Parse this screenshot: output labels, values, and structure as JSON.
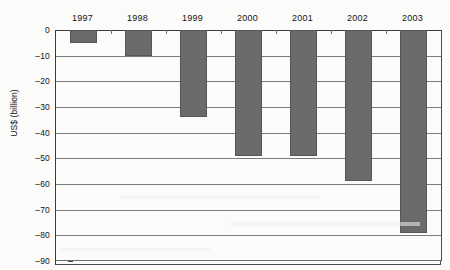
{
  "chart_data": {
    "type": "bar",
    "title": "",
    "xlabel": "",
    "ylabel": "US$ (billion)",
    "categories": [
      "1997",
      "1998",
      "1999",
      "2000",
      "2001",
      "2002",
      "2003"
    ],
    "values": [
      -5,
      -10,
      -34,
      -49,
      -49,
      -59,
      -79
    ],
    "series": [
      {
        "name": "US$ (billion)",
        "values": [
          -5,
          -10,
          -34,
          -49,
          -49,
          -59,
          -79
        ]
      }
    ],
    "ylim": [
      -90,
      0
    ],
    "ytick_labels": [
      "0",
      "–10",
      "–20",
      "–30",
      "–40",
      "–50",
      "–60",
      "–70",
      "–80",
      "–90"
    ],
    "ytick_values": [
      0,
      -10,
      -20,
      -30,
      -40,
      -50,
      -60,
      -70,
      -80,
      -90
    ],
    "ytick_step": 10,
    "grid": true,
    "grid_axis": "y",
    "legend": false,
    "legend_position": "none",
    "bar_color": "#6b6b6b",
    "bar_edge_color": "#565656",
    "axis_color": "#3b3b3b",
    "gridline_color": "#7b7b7b",
    "background_color": "#fbfbfa",
    "category_label_position": "top",
    "annotations": []
  },
  "page": {
    "cropped_title_text": "",
    "axis_title_text": "US$ (billion)"
  }
}
